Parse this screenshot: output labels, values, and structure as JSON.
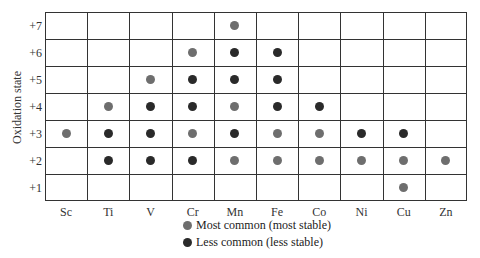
{
  "chart_data": {
    "type": "scatter",
    "title": "",
    "xlabel": "",
    "ylabel": "Oxidation state",
    "categories": [
      "Sc",
      "Ti",
      "V",
      "Cr",
      "Mn",
      "Fe",
      "Co",
      "Ni",
      "Cu",
      "Zn"
    ],
    "y_ticks": [
      "+7",
      "+6",
      "+5",
      "+4",
      "+3",
      "+2",
      "+1"
    ],
    "grid": true,
    "legend_position": "bottom",
    "series": [
      {
        "name": "Most common (most stable)",
        "color": "#6e6e6e",
        "points": [
          {
            "element": "Sc",
            "state": 3
          },
          {
            "element": "Ti",
            "state": 4
          },
          {
            "element": "V",
            "state": 5
          },
          {
            "element": "Cr",
            "state": 6
          },
          {
            "element": "Cr",
            "state": 3
          },
          {
            "element": "Mn",
            "state": 7
          },
          {
            "element": "Mn",
            "state": 4
          },
          {
            "element": "Mn",
            "state": 2
          },
          {
            "element": "Fe",
            "state": 3
          },
          {
            "element": "Fe",
            "state": 2
          },
          {
            "element": "Co",
            "state": 3
          },
          {
            "element": "Co",
            "state": 2
          },
          {
            "element": "Ni",
            "state": 2
          },
          {
            "element": "Cu",
            "state": 2
          },
          {
            "element": "Cu",
            "state": 1
          },
          {
            "element": "Zn",
            "state": 2
          }
        ]
      },
      {
        "name": "Less common (less stable)",
        "color": "#2a2a2a",
        "points": [
          {
            "element": "Ti",
            "state": 3
          },
          {
            "element": "Ti",
            "state": 2
          },
          {
            "element": "V",
            "state": 4
          },
          {
            "element": "V",
            "state": 3
          },
          {
            "element": "V",
            "state": 2
          },
          {
            "element": "Cr",
            "state": 5
          },
          {
            "element": "Cr",
            "state": 4
          },
          {
            "element": "Cr",
            "state": 2
          },
          {
            "element": "Mn",
            "state": 6
          },
          {
            "element": "Mn",
            "state": 5
          },
          {
            "element": "Mn",
            "state": 3
          },
          {
            "element": "Fe",
            "state": 6
          },
          {
            "element": "Fe",
            "state": 5
          },
          {
            "element": "Fe",
            "state": 4
          },
          {
            "element": "Co",
            "state": 4
          },
          {
            "element": "Ni",
            "state": 3
          },
          {
            "element": "Cu",
            "state": 3
          }
        ]
      }
    ]
  },
  "legend": {
    "items": [
      {
        "label": "Most common (most stable)",
        "color": "#6e6e6e"
      },
      {
        "label": "Less common (less stable)",
        "color": "#2a2a2a"
      }
    ]
  }
}
